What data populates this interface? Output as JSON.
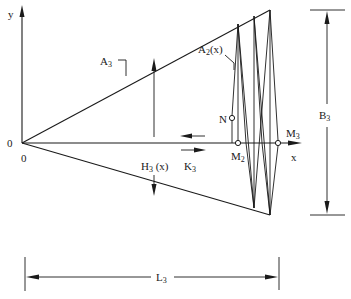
{
  "diagram": {
    "type": "geometric schematic",
    "axes": {
      "y_label": "y",
      "x_label": "x",
      "origin_y_label": "0",
      "origin_x_label": "0"
    },
    "labels": {
      "A3": {
        "main": "A",
        "sub": "3"
      },
      "A2x": {
        "main": "A",
        "sub": "2",
        "suffix": "(x)"
      },
      "H3x": {
        "main": "H",
        "sub": "3",
        "suffix": " (x)"
      },
      "K3": {
        "main": "K",
        "sub": "3"
      },
      "N": "N",
      "M2": {
        "main": "M",
        "sub": "2"
      },
      "M3": {
        "main": "M",
        "sub": "3"
      },
      "B3": {
        "main": "B",
        "sub": "3"
      },
      "L3": {
        "main": "L",
        "sub": "3"
      }
    },
    "dimensions": {
      "B3": "overall height of triangular region",
      "L3": "overall length of triangular region"
    },
    "colors": {
      "stroke": "#1a1a1a",
      "background": "#ffffff"
    }
  }
}
